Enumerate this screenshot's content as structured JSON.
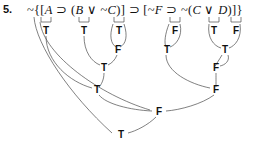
{
  "item": {
    "number": "5."
  },
  "formula": {
    "full_text": "~{[A ⊃ (B ∨ ~C)] ⊃ [~F ⊃ ~(C ∨ D)]}",
    "segments": [
      {
        "text": "~{[",
        "italic": false
      },
      {
        "text": "A",
        "italic": true
      },
      {
        "text": " ⊃ (",
        "italic": false
      },
      {
        "text": "B",
        "italic": true
      },
      {
        "text": " ∨ ~",
        "italic": false
      },
      {
        "text": "C",
        "italic": true
      },
      {
        "text": ")] ⊃ [~",
        "italic": false
      },
      {
        "text": "F",
        "italic": true
      },
      {
        "text": " ⊃ ~(",
        "italic": false
      },
      {
        "text": "C",
        "italic": true
      },
      {
        "text": " ∨ ",
        "italic": false
      },
      {
        "text": "D",
        "italic": true
      },
      {
        "text": ")]}",
        "italic": false
      }
    ]
  },
  "truth_values": {
    "row1": [
      {
        "label": "T",
        "x": 46,
        "y": 31,
        "under": "A"
      },
      {
        "label": "T",
        "x": 84,
        "y": 31,
        "under": "B"
      },
      {
        "label": "T",
        "x": 119,
        "y": 31,
        "under": "C"
      },
      {
        "label": "F",
        "x": 175,
        "y": 31,
        "under": "F"
      },
      {
        "label": "T",
        "x": 214,
        "y": 31,
        "under": "C"
      },
      {
        "label": "F",
        "x": 236,
        "y": 31,
        "under": "D"
      }
    ],
    "row2": [
      {
        "label": "F",
        "x": 118,
        "y": 50,
        "under": "~C"
      },
      {
        "label": "T",
        "x": 167,
        "y": 50,
        "under": "~F"
      },
      {
        "label": "T",
        "x": 225,
        "y": 50,
        "under": "C ∨ D"
      }
    ],
    "row3": [
      {
        "label": "T",
        "x": 104,
        "y": 68,
        "under": "B ∨ ~C"
      },
      {
        "label": "F",
        "x": 216,
        "y": 68,
        "under": "~(C ∨ D)"
      }
    ],
    "row4": [
      {
        "label": "T",
        "x": 97,
        "y": 90,
        "under": "A ⊃ (B ∨ ~C)"
      },
      {
        "label": "F",
        "x": 216,
        "y": 90,
        "under": "~F ⊃ ~(C ∨ D)"
      }
    ],
    "row5": [
      {
        "label": "F",
        "x": 159,
        "y": 112,
        "under": "main ⊃"
      }
    ],
    "row6": [
      {
        "label": "T",
        "x": 121,
        "y": 135,
        "under": "main ~"
      }
    ]
  },
  "colors": {
    "text": "#111111",
    "arc": "#4a4a4a",
    "background": "#ffffff"
  }
}
